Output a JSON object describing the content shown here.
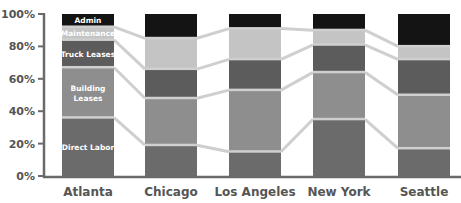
{
  "chart_data": {
    "type": "bar",
    "stacked": true,
    "normalized": true,
    "title": "",
    "xlabel": "",
    "ylabel": "",
    "ylim": [
      0,
      100
    ],
    "yticks": [
      "0%",
      "20%",
      "40%",
      "60%",
      "80%",
      "100%"
    ],
    "categories": [
      "Atlanta",
      "Chicago",
      "Los Angeles",
      "New York",
      "Seattle"
    ],
    "series": [
      {
        "name": "Direct Labor",
        "color": "#6b6b6b",
        "values": [
          36,
          19,
          15,
          35,
          17
        ]
      },
      {
        "name": "Building Leases",
        "color": "#8e8e8e",
        "values": [
          31,
          29,
          38,
          29,
          33
        ]
      },
      {
        "name": "Truck Leases",
        "color": "#5c5c5c",
        "values": [
          17,
          18,
          19,
          17,
          22
        ]
      },
      {
        "name": "Maintenance",
        "color": "#c4c4c4",
        "values": [
          8,
          19,
          19,
          9,
          8
        ]
      },
      {
        "name": "Admin",
        "color": "#141414",
        "values": [
          8,
          15,
          9,
          10,
          20
        ]
      }
    ],
    "segment_labels_on": "Atlanta",
    "connector_lines": true,
    "grid": false,
    "legend": "none (series labeled inside first bar)"
  }
}
